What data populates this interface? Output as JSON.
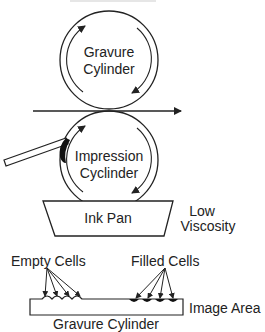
{
  "diagram": {
    "title_partial": "Gravure Process",
    "colors": {
      "stroke": "#222222",
      "fill": "#ffffff",
      "ink": "#111111"
    },
    "top_cylinder": {
      "line1": "Gravure",
      "line2": "Cylinder"
    },
    "bottom_cylinder": {
      "line1": "Impression",
      "line2": "Cyclinder"
    },
    "ink_pan": {
      "label": "Ink Pan"
    },
    "viscosity": {
      "line1": "Low",
      "line2": "Viscosity"
    },
    "detail": {
      "empty_cells_label": "Empty Cells",
      "filled_cells_label": "Filled Cells",
      "image_area_label": "Image Area",
      "cylinder_label": "Gravure Cylinder"
    }
  }
}
